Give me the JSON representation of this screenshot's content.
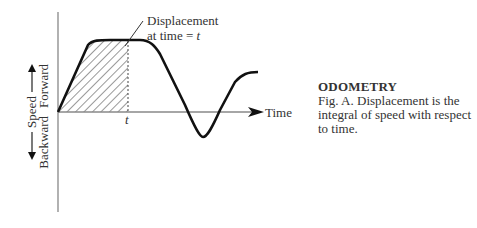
{
  "figure": {
    "y_axis": {
      "label": "Speed",
      "positive_label": "Forward",
      "negative_label": "Backward"
    },
    "x_axis": {
      "label": "Time",
      "tick_label": "t"
    },
    "annotation": {
      "line1": "Displacement",
      "line2": "at time = t"
    }
  },
  "caption": {
    "title": "ODOMETRY",
    "text": "Fig. A. Displacement is the integral of speed with respect to time."
  },
  "colors": {
    "curve": "#111111",
    "axis": "#888888",
    "text": "#333333"
  }
}
